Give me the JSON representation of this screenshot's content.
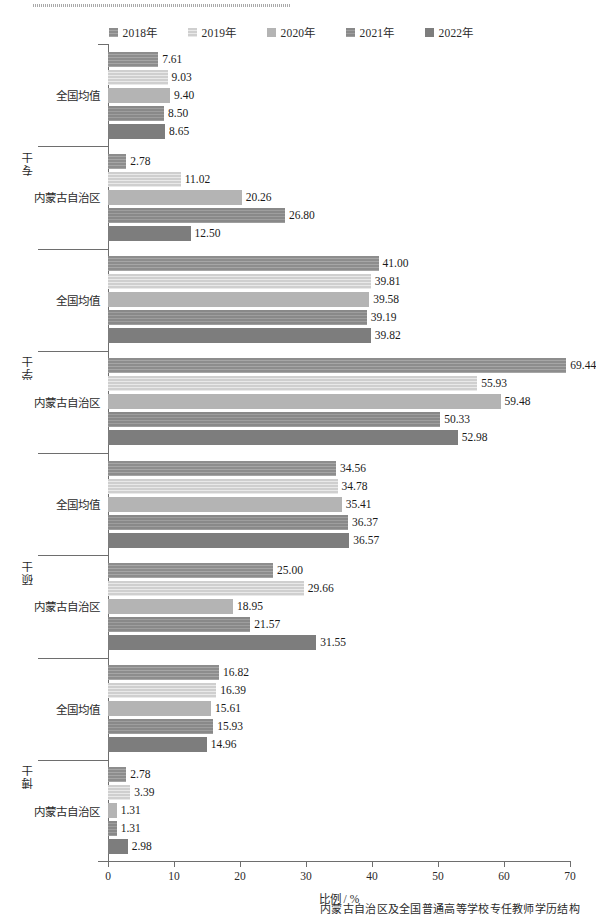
{
  "legend": {
    "items": [
      {
        "label": "2018年",
        "color": "#8d8d8d"
      },
      {
        "label": "2019年",
        "color": "#cfcfcf"
      },
      {
        "label": "2020年",
        "color": "#b4b4b4"
      },
      {
        "label": "2021年",
        "color": "#898989"
      },
      {
        "label": "2022年",
        "color": "#7d7d7d"
      }
    ]
  },
  "axis": {
    "x_title": "比例 / %",
    "x_ticks": [
      "0",
      "10",
      "20",
      "30",
      "40",
      "50",
      "60",
      "70"
    ]
  },
  "groups": [
    {
      "name": "专士",
      "rows": [
        {
          "label": "全国均值",
          "values": [
            "7.61",
            "9.03",
            "9.40",
            "8.50",
            "8.65"
          ]
        },
        {
          "label": "内蒙古自治区",
          "values": [
            "2.78",
            "11.02",
            "20.26",
            "26.80",
            "12.50"
          ]
        }
      ]
    },
    {
      "name": "学士",
      "rows": [
        {
          "label": "全国均值",
          "values": [
            "41.00",
            "39.81",
            "39.58",
            "39.19",
            "39.82"
          ]
        },
        {
          "label": "内蒙古自治区",
          "values": [
            "69.44",
            "55.93",
            "59.48",
            "50.33",
            "52.98"
          ]
        }
      ]
    },
    {
      "name": "硕士",
      "rows": [
        {
          "label": "全国均值",
          "values": [
            "34.56",
            "34.78",
            "35.41",
            "36.37",
            "36.57"
          ]
        },
        {
          "label": "内蒙古自治区",
          "values": [
            "25.00",
            "29.66",
            "18.95",
            "21.57",
            "31.55"
          ]
        }
      ]
    },
    {
      "name": "博士",
      "rows": [
        {
          "label": "全国均值",
          "values": [
            "16.82",
            "16.39",
            "15.61",
            "15.93",
            "14.96"
          ]
        },
        {
          "label": "内蒙古自治区",
          "values": [
            "2.78",
            "3.39",
            "1.31",
            "1.31",
            "2.98"
          ]
        }
      ]
    }
  ],
  "caption": "内蒙古自治区及全国普通高等学校专任教师学历结构",
  "chart_data": {
    "type": "bar",
    "orientation": "horizontal",
    "title": "",
    "xlabel": "比例 / %",
    "ylabel": "",
    "xlim": [
      0,
      70
    ],
    "xticks": [
      0,
      10,
      20,
      30,
      40,
      50,
      60,
      70
    ],
    "grid": false,
    "legend_position": "top-center",
    "series": [
      {
        "name": "2018年",
        "color": "#8d8d8d"
      },
      {
        "name": "2019年",
        "color": "#cfcfcf"
      },
      {
        "name": "2020年",
        "color": "#b4b4b4"
      },
      {
        "name": "2021年",
        "color": "#898989"
      },
      {
        "name": "2022年",
        "color": "#7d7d7d"
      }
    ],
    "categories": [
      "专士 - 全国均值",
      "专士 - 内蒙古自治区",
      "学士 - 全国均值",
      "学士 - 内蒙古自治区",
      "硕士 - 全国均值",
      "硕士 - 内蒙古自治区",
      "博士 - 全国均值",
      "博士 - 内蒙古自治区"
    ],
    "values": {
      "2018年": [
        7.61,
        2.78,
        41.0,
        69.44,
        34.56,
        25.0,
        16.82,
        2.78
      ],
      "2019年": [
        9.03,
        11.02,
        39.81,
        55.93,
        34.78,
        29.66,
        16.39,
        3.39
      ],
      "2020年": [
        9.4,
        20.26,
        39.58,
        59.48,
        35.41,
        18.95,
        15.61,
        1.31
      ],
      "2021年": [
        8.5,
        26.8,
        39.19,
        50.33,
        36.37,
        21.57,
        15.93,
        1.31
      ],
      "2022年": [
        8.65,
        12.5,
        39.82,
        52.98,
        36.57,
        31.55,
        14.96,
        2.98
      ]
    }
  }
}
